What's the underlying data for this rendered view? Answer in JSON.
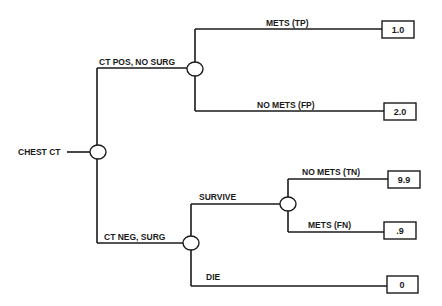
{
  "diagram": {
    "type": "decision-tree",
    "root": {
      "label": "CHEST CT"
    },
    "branches": {
      "ct_pos": {
        "label": "CT POS, NO SURG"
      },
      "ct_neg": {
        "label": "CT NEG, SURG"
      },
      "survive": {
        "label": "SURVIVE"
      },
      "die": {
        "label": "DIE"
      }
    },
    "outcomes": {
      "tp": {
        "label": "METS (TP)",
        "value": "1.0"
      },
      "fp": {
        "label": "NO METS (FP)",
        "value": "2.0"
      },
      "tn": {
        "label": "NO METS (TN)",
        "value": "9.9"
      },
      "fn": {
        "label": "METS (FN)",
        "value": ".9"
      },
      "die": {
        "value": "0"
      }
    }
  }
}
